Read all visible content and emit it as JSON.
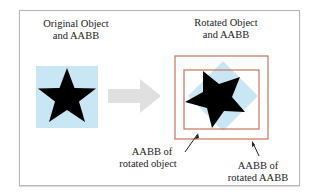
{
  "diagram": {
    "left_title_line1": "Original Object",
    "left_title_line2": "and AABB",
    "right_title_line1": "Rotated Object",
    "right_title_line2": "and AABB",
    "label_object_line1": "AABB of",
    "label_object_line2": "rotated object",
    "label_aabb_line1": "AABB of",
    "label_aabb_line2": "rotated AABB",
    "colors": {
      "aabb_fill": "#c9e6f5",
      "star": "#000000",
      "arrow": "#e0e0e0",
      "box_outline": "#c8735a",
      "frame_border": "#b5b5b5"
    }
  }
}
